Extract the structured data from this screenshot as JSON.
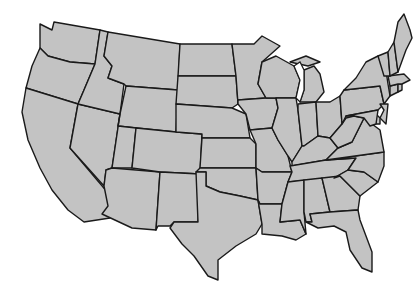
{
  "caption": {
    "text": ""
  },
  "map": {
    "title": "United States (contiguous 48 states)",
    "colors": {
      "fill": "#c3c3c3",
      "stroke": "#1a1a1a",
      "background": "#ffffff",
      "lakes": "#ffffff"
    },
    "states": [
      {
        "id": "WA",
        "d": "M40,24 L52,30 L54,22 L100,30 L95,64 L70,62 L48,56 L40,48 Z"
      },
      {
        "id": "OR",
        "d": "M40,48 L48,56 L70,62 L95,64 L84,90 L78,104 L26,88 L32,66 Z"
      },
      {
        "id": "CA",
        "d": "M26,88 L78,104 L70,148 L114,200 L116,212 L110,218 L84,222 L68,210 L52,190 L40,168 L28,140 L22,112 Z"
      },
      {
        "id": "NV",
        "d": "M78,104 L120,114 L112,168 L106,170 L104,186 L70,148 Z"
      },
      {
        "id": "ID",
        "d": "M100,30 L108,32 L104,56 L112,66 L108,78 L124,84 L120,114 L78,104 L84,90 L95,64 Z"
      },
      {
        "id": "MT",
        "d": "M108,32 L180,44 L178,90 L126,86 L124,84 L108,78 L112,66 L104,56 Z"
      },
      {
        "id": "WY",
        "d": "M126,86 L178,90 L176,132 L118,126 L120,114 Z"
      },
      {
        "id": "UT",
        "d": "M120,114 L118,126 L136,128 L132,168 L112,168 Z"
      },
      {
        "id": "AZ",
        "d": "M112,168 L160,172 L156,230 L132,228 L102,214 L108,206 L104,186 L106,170 Z"
      },
      {
        "id": "CO",
        "d": "M136,128 L176,132 L202,134 L200,174 L160,172 L132,168 Z"
      },
      {
        "id": "NM",
        "d": "M160,172 L200,174 L198,222 L174,222 L170,226 L158,226 L156,230 Z"
      },
      {
        "id": "ND",
        "d": "M180,44 L232,44 L236,76 L178,76 Z"
      },
      {
        "id": "SD",
        "d": "M178,76 L236,76 L238,104 L232,108 L176,104 Z"
      },
      {
        "id": "NE",
        "d": "M176,104 L232,108 L246,114 L250,138 L202,138 L202,134 L176,132 Z"
      },
      {
        "id": "KS",
        "d": "M202,138 L250,138 L256,144 L256,168 L200,168 Z"
      },
      {
        "id": "OK",
        "d": "M200,168 L256,168 L258,200 L240,196 L220,192 L206,186 L206,172 L196,172 Z"
      },
      {
        "id": "TX",
        "d": "M196,172 L206,172 L206,186 L220,192 L240,196 L258,200 L262,224 L256,234 L236,246 L218,260 L218,280 L208,276 L194,256 L182,244 L170,228 L174,222 L198,222 Z"
      },
      {
        "id": "MN",
        "d": "M232,44 L254,44 L262,36 L280,46 L262,62 L258,84 L266,98 L238,100 L238,104 L236,76 Z"
      },
      {
        "id": "IA",
        "d": "M238,100 L266,98 L276,98 L278,108 L272,128 L250,130 L246,114 L238,104 Z"
      },
      {
        "id": "MO",
        "d": "M250,130 L272,128 L278,140 L288,156 L292,172 L262,172 L256,168 L256,144 Z"
      },
      {
        "id": "AR",
        "d": "M256,168 L262,172 L292,172 L288,182 L282,204 L260,204 L258,200 Z"
      },
      {
        "id": "LA",
        "d": "M260,204 L282,204 L280,222 L300,220 L306,234 L296,240 L282,236 L262,234 L262,224 L258,200 Z"
      },
      {
        "id": "WI",
        "d": "M262,62 L276,56 L294,66 L300,80 L296,98 L276,98 L266,98 L258,84 Z"
      },
      {
        "id": "IL",
        "d": "M276,98 L296,98 L298,110 L302,146 L292,162 L288,156 L278,140 L272,128 L278,108 Z"
      },
      {
        "id": "MI",
        "d": "M290,62 L306,56 L320,62 L308,66 Z M304,70 L314,66 L320,74 L324,92 L316,102 L300,102 L304,90 Z"
      },
      {
        "id": "IN",
        "d": "M298,104 L316,102 L318,136 L304,146 L302,146 L298,110 Z"
      },
      {
        "id": "OH",
        "d": "M316,102 L330,102 L340,96 L342,124 L330,138 L318,136 Z"
      },
      {
        "id": "KY",
        "d": "M292,162 L302,146 L304,146 L318,136 L330,138 L338,148 L326,160 L292,166 Z"
      },
      {
        "id": "TN",
        "d": "M290,166 L326,160 L356,158 L348,170 L334,178 L288,182 L292,172 Z"
      },
      {
        "id": "MS",
        "d": "M288,182 L304,180 L304,212 L306,234 L300,220 L280,222 L282,204 Z"
      },
      {
        "id": "AL",
        "d": "M304,180 L322,178 L330,212 L310,214 L312,222 L306,222 L304,212 Z"
      },
      {
        "id": "GA",
        "d": "M322,178 L340,176 L360,196 L358,210 L330,212 Z"
      },
      {
        "id": "FL",
        "d": "M306,222 L312,222 L310,214 L330,212 L358,210 L360,220 L372,252 L372,272 L362,268 L350,250 L346,232 L334,226 L318,228 Z"
      },
      {
        "id": "SC",
        "d": "M334,178 L348,170 L364,172 L378,182 L360,196 L340,176 Z"
      },
      {
        "id": "NC",
        "d": "M326,160 L384,152 L384,166 L378,182 L364,172 L348,170 L356,158 Z"
      },
      {
        "id": "VA",
        "d": "M338,148 L352,142 L364,118 L380,130 L384,152 L326,160 Z"
      },
      {
        "id": "WV",
        "d": "M330,138 L342,124 L346,118 L354,116 L364,118 L352,142 L338,148 Z"
      },
      {
        "id": "PA",
        "d": "M340,96 L344,90 L380,86 L384,104 L378,110 L346,116 L342,124 Z"
      },
      {
        "id": "NY",
        "d": "M344,90 L356,78 L366,62 L378,56 L384,58 L388,84 L390,96 L384,104 L380,86 Z"
      },
      {
        "id": "NJ",
        "d": "M380,104 L388,104 L386,124 L380,118 L384,110 Z"
      },
      {
        "id": "DE",
        "d": "M376,114 L380,118 L380,124 L376,124 Z"
      },
      {
        "id": "MD",
        "d": "M346,116 L378,110 L376,124 L370,126 L364,118 L354,116 Z"
      },
      {
        "id": "CT",
        "d": "M390,86 L398,84 L398,92 L390,96 Z"
      },
      {
        "id": "RI",
        "d": "M398,84 L402,84 L402,90 L398,92 Z"
      },
      {
        "id": "MA",
        "d": "M388,76 L404,74 L410,80 L402,84 L398,84 L390,86 Z"
      },
      {
        "id": "VT",
        "d": "M378,56 L388,52 L390,76 L384,76 Z"
      },
      {
        "id": "NH",
        "d": "M388,52 L394,42 L398,72 L390,76 Z"
      },
      {
        "id": "ME",
        "d": "M394,42 L398,22 L404,14 L410,30 L412,38 L406,50 L398,72 Z"
      }
    ],
    "lakes": [
      {
        "id": "lake-michigan",
        "d": "M294,66 L300,62 L304,70 L304,90 L300,102 L296,98 L300,80 Z"
      }
    ]
  }
}
